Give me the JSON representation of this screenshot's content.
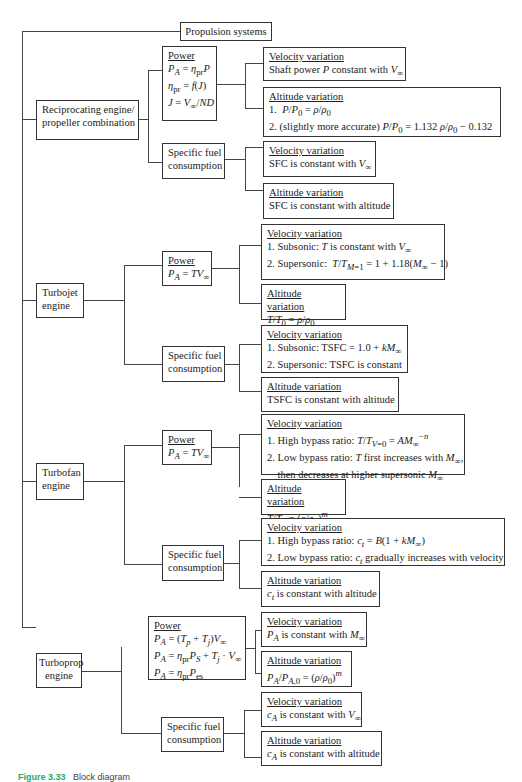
{
  "root": {
    "label": "Propulsion systems"
  },
  "engines": [
    {
      "label_lines": [
        "Reciprocating engine/",
        "propeller combination"
      ],
      "power": {
        "header": "Power",
        "lines": [
          "P_A = η_pr P",
          "η_pr = f(J)",
          "J = V∞ / ND"
        ]
      },
      "power_velocity": {
        "header": "Velocity variation",
        "lines": [
          "Shaft power P constant with V∞"
        ]
      },
      "power_altitude": {
        "header": "Altitude variation",
        "lines": [
          "1.  P/P₀ = ρ/ρ₀",
          "2. (slightly more accurate) P/P₀ = 1.132 ρ/ρ₀ − 0.132"
        ]
      },
      "fuel": {
        "label_lines": [
          "Specific fuel",
          "consumption"
        ]
      },
      "fuel_velocity": {
        "header": "Velocity variation",
        "lines": [
          "SFC is constant with V∞"
        ]
      },
      "fuel_altitude": {
        "header": "Altitude variation",
        "lines": [
          "SFC is constant with altitude"
        ]
      }
    },
    {
      "label_lines": [
        "Turbojet",
        "engine"
      ],
      "power": {
        "header": "Power",
        "lines": [
          "P_A = TV∞"
        ]
      },
      "power_velocity": {
        "header": "Velocity variation",
        "lines": [
          "1. Subsonic: T is constant with V∞",
          "2. Supersonic:  T / T_M=1 = 1 + 1.18(M∞ − 1)"
        ]
      },
      "power_altitude": {
        "header": "Altitude variation",
        "lines": [
          "T/T₀ = ρ/ρ₀"
        ]
      },
      "fuel": {
        "label_lines": [
          "Specific fuel",
          "consumption"
        ]
      },
      "fuel_velocity": {
        "header": "Velocity variation",
        "lines": [
          "1. Subsonic: TSFC = 1.0 + kM∞",
          "2. Supersonic: TSFC is constant"
        ]
      },
      "fuel_altitude": {
        "header": "Altitude variation",
        "lines": [
          "TSFC is constant with altitude"
        ]
      }
    },
    {
      "label_lines": [
        "Turbofan",
        "engine"
      ],
      "power": {
        "header": "Power",
        "lines": [
          "P_A = TV∞"
        ]
      },
      "power_velocity": {
        "header": "Velocity variation",
        "lines": [
          "1. High bypass ratio: T/T_V=0 = AM∞^−n",
          "2. Low bypass ratio: T first increases with M∞,",
          "    then decreases at higher supersonic M∞"
        ]
      },
      "power_altitude": {
        "header": "Altitude variation",
        "lines": [
          "T/T₀ = (ρ/ρ₀)^m"
        ]
      },
      "fuel": {
        "label_lines": [
          "Specific fuel",
          "consumption"
        ]
      },
      "fuel_velocity": {
        "header": "Velocity variation",
        "lines": [
          "1. High bypass ratio: c_t = B(1 + kM∞)",
          "2. Low bypass ratio: c_t gradually increases with velocity"
        ]
      },
      "fuel_altitude": {
        "header": "Altitude variation",
        "lines": [
          "c_t is constant with altitude"
        ]
      }
    },
    {
      "label_lines": [
        "Turboprop",
        "engine"
      ],
      "power": {
        "header": "Power",
        "lines": [
          "P_A = (T_p + T_j)V∞",
          "P_A = η_pr P_S + T_j · V∞",
          "P_A = η_pr P_es"
        ]
      },
      "power_velocity": {
        "header": "Velocity variation",
        "lines": [
          "P_A is constant with M∞"
        ]
      },
      "power_altitude": {
        "header": "Altitude variation",
        "lines": [
          "P_A/P_A,0 = (ρ/ρ₀)^m"
        ]
      },
      "fuel": {
        "label_lines": [
          "Specific fuel",
          "consumption"
        ]
      },
      "fuel_velocity": {
        "header": "Velocity variation",
        "lines": [
          "c_A is constant with V∞"
        ]
      },
      "fuel_altitude": {
        "header": "Altitude variation",
        "lines": [
          "c_A is constant with altitude"
        ]
      }
    }
  ],
  "caption": {
    "label": "Figure 3.33",
    "text": "Block diagram"
  }
}
